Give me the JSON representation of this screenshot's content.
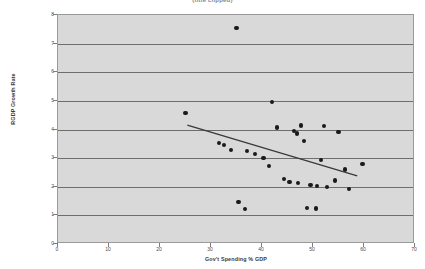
{
  "chart_data": {
    "type": "scatter",
    "title": "(title clipped)",
    "xlabel": "Gov't Spending % GDP",
    "ylabel": "RGDP Growth Rate",
    "xlim": [
      0,
      70
    ],
    "ylim": [
      0,
      8
    ],
    "x_ticks": [
      0,
      10,
      20,
      30,
      40,
      50,
      60,
      70
    ],
    "y_ticks": [
      0,
      1,
      2,
      3,
      4,
      5,
      6,
      7,
      8
    ],
    "grid": "horizontal",
    "legend": "none",
    "marker_color": "#1a1a1a",
    "plot_background": "#d9d9d9",
    "gridline_color": "#6e6e6e",
    "trendline": {
      "color": "#3a3a3a",
      "x_start": 25.5,
      "y_start": 4.12,
      "x_end": 59.0,
      "y_end": 2.33
    },
    "points": [
      {
        "x": 25.0,
        "y": 4.58
      },
      {
        "x": 35.0,
        "y": 7.55
      },
      {
        "x": 31.5,
        "y": 3.52
      },
      {
        "x": 32.6,
        "y": 3.45
      },
      {
        "x": 34.0,
        "y": 3.28
      },
      {
        "x": 35.4,
        "y": 1.47
      },
      {
        "x": 36.7,
        "y": 1.22
      },
      {
        "x": 37.0,
        "y": 3.26
      },
      {
        "x": 38.6,
        "y": 3.15
      },
      {
        "x": 40.3,
        "y": 3.0
      },
      {
        "x": 41.4,
        "y": 2.72
      },
      {
        "x": 42.0,
        "y": 4.97
      },
      {
        "x": 43.0,
        "y": 4.07
      },
      {
        "x": 44.3,
        "y": 2.28
      },
      {
        "x": 45.4,
        "y": 2.18
      },
      {
        "x": 46.3,
        "y": 3.96
      },
      {
        "x": 46.9,
        "y": 3.86
      },
      {
        "x": 47.0,
        "y": 2.14
      },
      {
        "x": 47.6,
        "y": 4.14
      },
      {
        "x": 48.3,
        "y": 3.6
      },
      {
        "x": 48.9,
        "y": 1.26
      },
      {
        "x": 49.5,
        "y": 2.05
      },
      {
        "x": 50.6,
        "y": 1.24
      },
      {
        "x": 50.8,
        "y": 2.02
      },
      {
        "x": 51.5,
        "y": 2.94
      },
      {
        "x": 52.2,
        "y": 4.13
      },
      {
        "x": 52.8,
        "y": 1.98
      },
      {
        "x": 54.3,
        "y": 2.22
      },
      {
        "x": 55.0,
        "y": 3.92
      },
      {
        "x": 56.3,
        "y": 2.6
      },
      {
        "x": 57.0,
        "y": 1.92
      },
      {
        "x": 59.7,
        "y": 2.8
      }
    ]
  }
}
